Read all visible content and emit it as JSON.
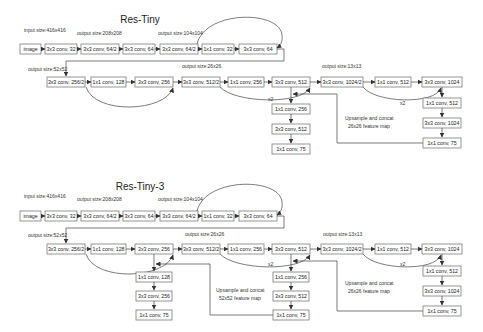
{
  "diagrams": [
    {
      "title": "Res-Tiny",
      "size_labels": {
        "input": "input size:416x416",
        "s208": "output size:208x208",
        "s104": "output size:104x104",
        "s52": "output size:52x52",
        "s26": "output size:26x26",
        "s13": "output size:13x13"
      },
      "row1": [
        "image",
        "3x3 conv, 32",
        "3x3 conv, 64/2",
        "3x3 conv, 64",
        "3x3 conv, 64/2",
        "1x1 conv, 32",
        "3x3 conv, 64"
      ],
      "row2": [
        "3x3 conv, 256/2",
        "1x1 conv, 128",
        "3x3 conv, 256",
        "3x3 conv, 512/2",
        "1x1 conv, 256",
        "3x3 conv, 512",
        "3x3 conv, 1024/2",
        "1x1 conv, 512",
        "3x3 conv, 1024"
      ],
      "branch26": [
        "1x1 conv, 256",
        "3x3 conv, 512",
        "1x1 conv, 75"
      ],
      "branch13": [
        "1x1 conv, 512",
        "3x3 conv, 1024",
        "1x1 conv, 75"
      ],
      "upsample_label_1": "Upsample and concat",
      "upsample_label_2": "26x26 feature map",
      "x2_a": "x2",
      "x2_b": "x2"
    },
    {
      "title": "Res-Tiny-3",
      "size_labels": {
        "input": "input size:416x416",
        "s208": "output size:208x208",
        "s104": "output size:104x104",
        "s52": "output size:52x52",
        "s26": "output size:26x26",
        "s13": "output size:13x13"
      },
      "row1": [
        "image",
        "3x3 conv, 32",
        "3x3 conv, 64/2",
        "3x3 conv, 64",
        "3x3 conv, 64/2",
        "1x1 conv, 32",
        "3x3 conv, 64"
      ],
      "row2": [
        "3x3 conv, 256/2",
        "1x1 conv, 128",
        "3x3 conv, 256",
        "3x3 conv, 512/2",
        "1x1 conv, 256",
        "3x3 conv, 512",
        "3x3 conv, 1024/2",
        "1x1 conv, 512",
        "3x3 conv, 1024"
      ],
      "branch52": [
        "1x1 conv, 128",
        "3x3 conv, 256",
        "1x1 conv, 75"
      ],
      "branch26": [
        "1x1 conv, 256",
        "3x3 conv, 512",
        "1x1 conv, 75"
      ],
      "branch13": [
        "1x1 conv, 512",
        "3x3 conv, 1024",
        "1x1 conv, 75"
      ],
      "upsample52_label_1": "Upsample and concat",
      "upsample52_label_2": "52x52 feature map",
      "upsample26_label_1": "Upsample and concat",
      "upsample26_label_2": "26x26 feature map",
      "x2_a": "x2",
      "x2_b": "x2"
    }
  ]
}
